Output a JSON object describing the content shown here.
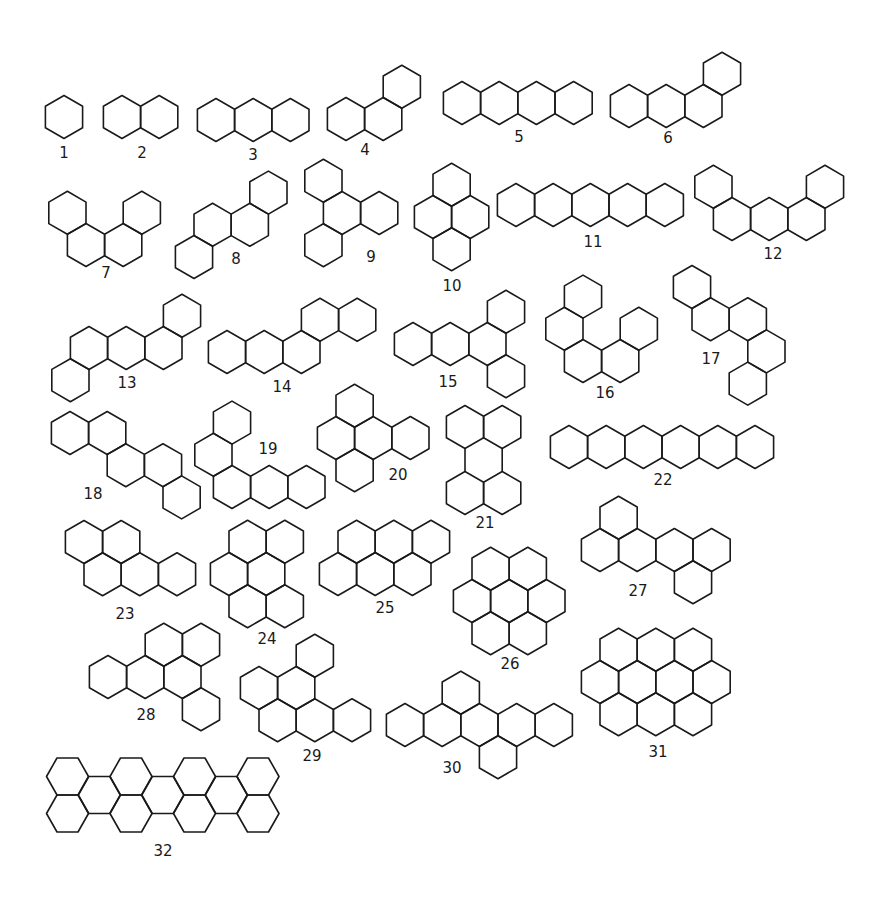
{
  "figure": {
    "stroke_color": "#1a1a1a",
    "background": "#ffffff",
    "hex_half_width": 18.6,
    "hex_side": 21.5,
    "row_step": 32.2
  },
  "molecules": [
    {
      "id": "1",
      "label": "1",
      "base": [
        64,
        117
      ],
      "hexes": [
        [
          0,
          0
        ]
      ],
      "label_pos": [
        64,
        153
      ]
    },
    {
      "id": "2",
      "label": "2",
      "base": [
        122,
        117
      ],
      "hexes": [
        [
          0,
          0
        ],
        [
          2,
          0
        ]
      ],
      "label_pos": [
        142,
        153
      ]
    },
    {
      "id": "3",
      "label": "3",
      "base": [
        216,
        120
      ],
      "hexes": [
        [
          0,
          0
        ],
        [
          2,
          0
        ],
        [
          4,
          0
        ]
      ],
      "label_pos": [
        253,
        155
      ]
    },
    {
      "id": "4",
      "label": "4",
      "base": [
        346,
        119
      ],
      "hexes": [
        [
          0,
          0
        ],
        [
          2,
          0
        ],
        [
          3,
          -1
        ]
      ],
      "label_pos": [
        365,
        150
      ]
    },
    {
      "id": "5",
      "label": "5",
      "base": [
        462,
        103
      ],
      "hexes": [
        [
          0,
          0
        ],
        [
          2,
          0
        ],
        [
          4,
          0
        ],
        [
          6,
          0
        ]
      ],
      "label_pos": [
        519,
        137
      ]
    },
    {
      "id": "6",
      "label": "6",
      "base": [
        629,
        106
      ],
      "hexes": [
        [
          0,
          0
        ],
        [
          2,
          0
        ],
        [
          4,
          0
        ],
        [
          5,
          -1
        ]
      ],
      "label_pos": [
        668,
        138
      ]
    },
    {
      "id": "7",
      "label": "7",
      "base": [
        86,
        245
      ],
      "hexes": [
        [
          0,
          0
        ],
        [
          2,
          0
        ],
        [
          -1,
          -1
        ],
        [
          3,
          -1
        ]
      ],
      "label_pos": [
        106,
        273
      ]
    },
    {
      "id": "8",
      "label": "8",
      "base": [
        194,
        257
      ],
      "hexes": [
        [
          0,
          0
        ],
        [
          1,
          -1
        ],
        [
          3,
          -1
        ],
        [
          4,
          -2
        ]
      ],
      "label_pos": [
        236,
        259
      ]
    },
    {
      "id": "9",
      "label": "9",
      "base": [
        342,
        213
      ],
      "hexes": [
        [
          0,
          0
        ],
        [
          -1,
          -1
        ],
        [
          2,
          0
        ],
        [
          -1,
          1
        ]
      ],
      "label_pos": [
        371,
        257
      ]
    },
    {
      "id": "10",
      "label": "10",
      "base": [
        433,
        217
      ],
      "hexes": [
        [
          0,
          0
        ],
        [
          2,
          0
        ],
        [
          1,
          -1
        ],
        [
          1,
          1
        ]
      ],
      "label_pos": [
        452,
        286
      ]
    },
    {
      "id": "11",
      "label": "11",
      "base": [
        516,
        205
      ],
      "hexes": [
        [
          0,
          0
        ],
        [
          2,
          0
        ],
        [
          4,
          0
        ],
        [
          6,
          0
        ],
        [
          8,
          0
        ]
      ],
      "label_pos": [
        593,
        242
      ]
    },
    {
      "id": "12",
      "label": "12",
      "base": [
        732,
        219
      ],
      "hexes": [
        [
          0,
          0
        ],
        [
          2,
          0
        ],
        [
          4,
          0
        ],
        [
          -1,
          -1
        ],
        [
          5,
          -1
        ]
      ],
      "label_pos": [
        773,
        254
      ]
    },
    {
      "id": "13",
      "label": "13",
      "base": [
        89,
        348
      ],
      "hexes": [
        [
          0,
          0
        ],
        [
          2,
          0
        ],
        [
          4,
          0
        ],
        [
          -1,
          1
        ],
        [
          5,
          -1
        ]
      ],
      "label_pos": [
        127,
        383
      ]
    },
    {
      "id": "14",
      "label": "14",
      "base": [
        227,
        352
      ],
      "hexes": [
        [
          0,
          0
        ],
        [
          2,
          0
        ],
        [
          4,
          0
        ],
        [
          5,
          -1
        ],
        [
          7,
          -1
        ]
      ],
      "label_pos": [
        282,
        387
      ]
    },
    {
      "id": "15",
      "label": "15",
      "base": [
        413,
        344
      ],
      "hexes": [
        [
          0,
          0
        ],
        [
          2,
          0
        ],
        [
          4,
          0
        ],
        [
          5,
          -1
        ],
        [
          5,
          1
        ]
      ],
      "label_pos": [
        448,
        382
      ]
    },
    {
      "id": "16",
      "label": "16",
      "base": [
        583,
        361
      ],
      "hexes": [
        [
          0,
          0
        ],
        [
          2,
          0
        ],
        [
          -1,
          -1
        ],
        [
          0,
          -2
        ],
        [
          3,
          -1
        ]
      ],
      "label_pos": [
        605,
        393
      ]
    },
    {
      "id": "17",
      "label": "17",
      "base": [
        692,
        287
      ],
      "hexes": [
        [
          0,
          0
        ],
        [
          1,
          1
        ],
        [
          3,
          1
        ],
        [
          4,
          2
        ],
        [
          3,
          3
        ]
      ],
      "label_pos": [
        711,
        359
      ]
    },
    {
      "id": "18",
      "label": "18",
      "base": [
        70,
        433
      ],
      "hexes": [
        [
          0,
          0
        ],
        [
          2,
          0
        ],
        [
          3,
          1
        ],
        [
          5,
          1
        ],
        [
          6,
          2
        ]
      ],
      "label_pos": [
        93,
        494
      ]
    },
    {
      "id": "19",
      "label": "19",
      "base": [
        232,
        487
      ],
      "hexes": [
        [
          0,
          0
        ],
        [
          2,
          0
        ],
        [
          4,
          0
        ],
        [
          -1,
          -1
        ],
        [
          0,
          -2
        ]
      ],
      "label_pos": [
        268,
        449
      ]
    },
    {
      "id": "20",
      "label": "20",
      "base": [
        336,
        438
      ],
      "hexes": [
        [
          0,
          0
        ],
        [
          2,
          0
        ],
        [
          4,
          0
        ],
        [
          1,
          -1
        ],
        [
          1,
          1
        ]
      ],
      "label_pos": [
        398,
        475
      ]
    },
    {
      "id": "21",
      "label": "21",
      "base": [
        465,
        427
      ],
      "hexes": [
        [
          0,
          0
        ],
        [
          2,
          0
        ],
        [
          0,
          2.05
        ],
        [
          2,
          2.05
        ]
      ],
      "connectors": [
        [
          [
            465,
            448.5
          ],
          [
            465,
            471.5
          ]
        ],
        [
          [
            502.2,
            448.5
          ],
          [
            502.2,
            471.5
          ]
        ]
      ],
      "label_pos": [
        485,
        523
      ]
    },
    {
      "id": "22",
      "label": "22",
      "base": [
        569,
        447
      ],
      "hexes": [
        [
          0,
          0
        ],
        [
          2,
          0
        ],
        [
          4,
          0
        ],
        [
          6,
          0
        ],
        [
          8,
          0
        ],
        [
          10,
          0
        ]
      ],
      "label_pos": [
        663,
        480
      ]
    },
    {
      "id": "23",
      "label": "23",
      "base": [
        84,
        542
      ],
      "hexes": [
        [
          0,
          0
        ],
        [
          2,
          0
        ],
        [
          1,
          1
        ],
        [
          3,
          1
        ],
        [
          5,
          1
        ]
      ],
      "label_pos": [
        125,
        614
      ]
    },
    {
      "id": "24",
      "label": "24",
      "base": [
        229,
        574
      ],
      "hexes": [
        [
          0,
          0
        ],
        [
          2,
          0
        ],
        [
          1,
          -1
        ],
        [
          3,
          -1
        ],
        [
          1,
          1
        ],
        [
          3,
          1
        ]
      ],
      "label_pos": [
        267,
        639
      ]
    },
    {
      "id": "25",
      "label": "25",
      "base": [
        338,
        574
      ],
      "hexes": [
        [
          0,
          0
        ],
        [
          2,
          0
        ],
        [
          4,
          0
        ],
        [
          1,
          -1
        ],
        [
          3,
          -1
        ],
        [
          5,
          -1
        ]
      ],
      "label_pos": [
        385,
        608
      ]
    },
    {
      "id": "26",
      "label": "26",
      "base": [
        472,
        601
      ],
      "hexes": [
        [
          0,
          0
        ],
        [
          2,
          0
        ],
        [
          4,
          0
        ],
        [
          1,
          -1
        ],
        [
          3,
          -1
        ],
        [
          1,
          1
        ],
        [
          3,
          1
        ]
      ],
      "label_pos": [
        510,
        664
      ]
    },
    {
      "id": "27",
      "label": "27",
      "base": [
        600,
        550
      ],
      "hexes": [
        [
          0,
          0
        ],
        [
          2,
          0
        ],
        [
          4,
          0
        ],
        [
          6,
          0
        ],
        [
          1,
          -1
        ],
        [
          5,
          1
        ]
      ],
      "label_pos": [
        638,
        591
      ]
    },
    {
      "id": "28",
      "label": "28",
      "base": [
        108,
        677
      ],
      "hexes": [
        [
          0,
          0
        ],
        [
          2,
          0
        ],
        [
          4,
          0
        ],
        [
          3,
          -1
        ],
        [
          5,
          -1
        ],
        [
          5,
          1
        ]
      ],
      "label_pos": [
        146,
        715
      ]
    },
    {
      "id": "29",
      "label": "29",
      "base": [
        259,
        688
      ],
      "hexes": [
        [
          0,
          0
        ],
        [
          2,
          0
        ],
        [
          3,
          -1
        ],
        [
          1,
          1
        ],
        [
          3,
          1
        ],
        [
          5,
          1
        ]
      ],
      "label_pos": [
        312,
        756
      ]
    },
    {
      "id": "30",
      "label": "30",
      "base": [
        405,
        725
      ],
      "hexes": [
        [
          0,
          0
        ],
        [
          2,
          0
        ],
        [
          4,
          0
        ],
        [
          6,
          0
        ],
        [
          8,
          0
        ],
        [
          3,
          -1
        ],
        [
          5,
          1
        ]
      ],
      "label_pos": [
        452,
        768
      ]
    },
    {
      "id": "31",
      "label": "31",
      "base": [
        600,
        682
      ],
      "hexes": [
        [
          0,
          0
        ],
        [
          2,
          0
        ],
        [
          4,
          0
        ],
        [
          6,
          0
        ],
        [
          1,
          -1
        ],
        [
          3,
          -1
        ],
        [
          5,
          -1
        ],
        [
          1,
          1
        ],
        [
          3,
          1
        ],
        [
          5,
          1
        ]
      ],
      "label_pos": [
        658,
        752
      ]
    }
  ],
  "flat_molecules": [
    {
      "id": "32",
      "label": "32",
      "side": 21,
      "half_height": 18.5,
      "centers": [
        [
          67.5,
          776.5
        ],
        [
          131,
          776.5
        ],
        [
          194.5,
          776.5
        ],
        [
          258,
          776.5
        ],
        [
          67.5,
          813.5
        ],
        [
          131,
          813.5
        ],
        [
          194.5,
          813.5
        ],
        [
          258,
          813.5
        ],
        [
          99.25,
          795
        ],
        [
          162.75,
          795
        ],
        [
          226.25,
          795
        ]
      ],
      "label_pos": [
        163,
        851
      ]
    }
  ]
}
